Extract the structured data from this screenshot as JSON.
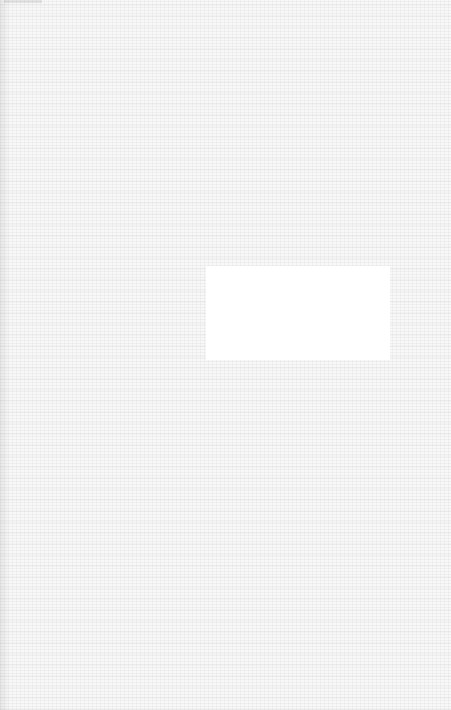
{
  "page": {
    "background_color": "#f8f8f8",
    "texture": "faint-noisy-paper",
    "blank_panel": {
      "color": "#ffffff",
      "text": ""
    }
  }
}
